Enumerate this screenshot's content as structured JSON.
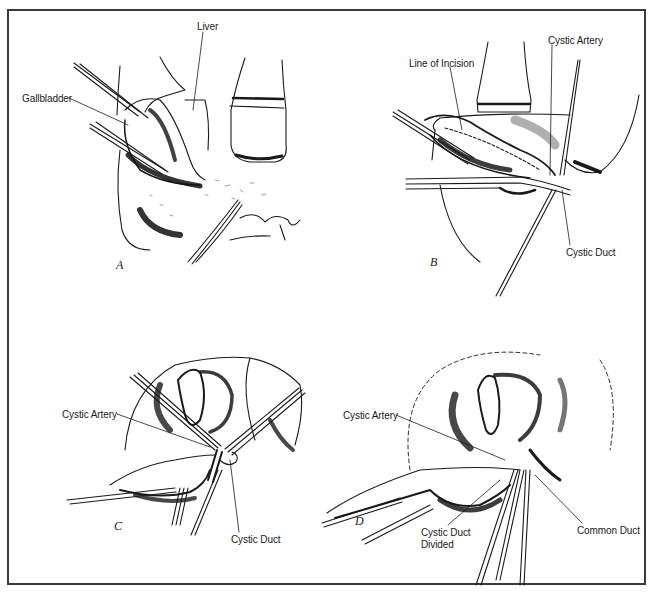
{
  "figure": {
    "border_color": "#3a3a3a",
    "ink_color": "#1a1a1a",
    "panels": [
      {
        "id": "A",
        "letter": "A",
        "letter_pos": [
          116,
          265
        ],
        "labels": [
          {
            "text": "Liver",
            "pos": [
              197,
              21
            ]
          },
          {
            "text": "Gallbladder",
            "pos": [
              22,
              93
            ]
          }
        ]
      },
      {
        "id": "B",
        "letter": "B",
        "letter_pos": [
          430,
          262
        ],
        "labels": [
          {
            "text": "Cystic Artery",
            "pos": [
              548,
              35
            ]
          },
          {
            "text": "Line of Incision",
            "pos": [
              409,
              58
            ]
          },
          {
            "text": "Cystic Duct",
            "pos": [
              566,
              247
            ]
          }
        ]
      },
      {
        "id": "C",
        "letter": "C",
        "letter_pos": [
          114,
          526
        ],
        "labels": [
          {
            "text": "Cystic Artery",
            "pos": [
              62,
              409
            ]
          },
          {
            "text": "Cystic Duct",
            "pos": [
              231,
              534
            ]
          }
        ]
      },
      {
        "id": "D",
        "letter": "D",
        "letter_pos": [
          355,
          521
        ],
        "labels": [
          {
            "text": "Cystic Artery",
            "pos": [
              343,
              410
            ]
          },
          {
            "text": "Common Duct",
            "pos": [
              577,
              525
            ]
          },
          {
            "text": "Cystic Duct",
            "pos": [
              421,
              527
            ]
          },
          {
            "text": "Divided",
            "pos": [
              421,
              539
            ]
          }
        ]
      }
    ]
  }
}
